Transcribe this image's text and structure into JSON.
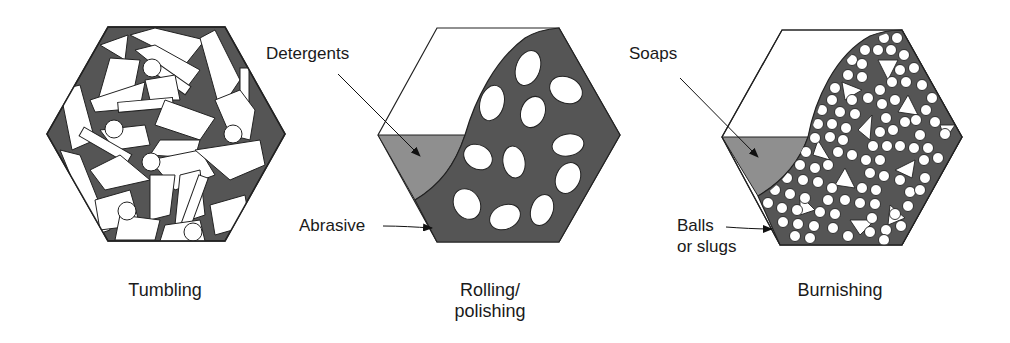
{
  "figure": {
    "panels": [
      {
        "id": "tumbling",
        "caption": "Tumbling",
        "callouts": []
      },
      {
        "id": "rolling",
        "caption_line1": "Rolling/",
        "caption_line2": "polishing",
        "callouts": [
          {
            "text": "Detergents"
          },
          {
            "text": "Abrasive"
          }
        ]
      },
      {
        "id": "burnishing",
        "caption": "Burnishing",
        "callouts": [
          {
            "text": "Soaps"
          },
          {
            "text_line1": "Balls",
            "text_line2": "or slugs"
          }
        ]
      }
    ],
    "colors": {
      "dark_fill": "#555555",
      "light_fill": "#8f8f8f",
      "outline": "#222222",
      "white": "#ffffff"
    }
  }
}
